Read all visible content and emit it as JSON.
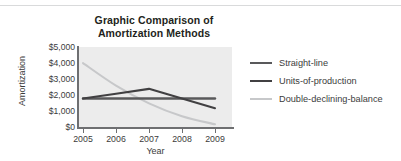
{
  "title": {
    "line1": "Graphic Comparison of",
    "line2": "Amortization Methods"
  },
  "axes": {
    "ylabel": "Amortization",
    "xlabel": "Year",
    "yticks": [
      "$5,000",
      "$4,000",
      "$3,000",
      "$2,000",
      "$1,000",
      "$0"
    ],
    "xticks": [
      "2005",
      "2006",
      "2007",
      "2008",
      "2009"
    ]
  },
  "legend": [
    {
      "label": "Straight-line",
      "color": "#59595b"
    },
    {
      "label": "Units-of-production",
      "color": "#414042"
    },
    {
      "label": "Double-declining-balance",
      "color": "#c7c8ca"
    }
  ],
  "colors": {
    "plot_background": "#ececec",
    "axis": "#6e6f71",
    "text": "#3b3b3b",
    "title": "#231f20",
    "page_background": "#ffffff"
  },
  "chart_data": {
    "type": "line",
    "title": "Graphic Comparison of Amortization Methods",
    "xlabel": "Year",
    "ylabel": "Amortization",
    "categories": [
      "2005",
      "2006",
      "2007",
      "2008",
      "2009"
    ],
    "ylim": [
      0,
      5000
    ],
    "ytick_values": [
      0,
      1000,
      2000,
      3000,
      4000,
      5000
    ],
    "grid": false,
    "legend_position": "right",
    "series": [
      {
        "name": "Straight-line",
        "color": "#59595b",
        "values": [
          1800,
          1800,
          1800,
          1800,
          1800
        ]
      },
      {
        "name": "Units-of-production",
        "color": "#414042",
        "values": [
          1800,
          2100,
          2400,
          1800,
          1200
        ]
      },
      {
        "name": "Double-declining-balance",
        "color": "#c7c8ca",
        "values": [
          4000,
          2600,
          1500,
          700,
          200
        ]
      }
    ]
  }
}
